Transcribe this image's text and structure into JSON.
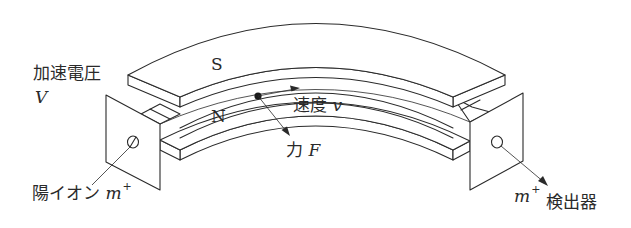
{
  "diagram": {
    "type": "mass-spectrometer",
    "labels": {
      "accel_voltage": "加速電圧",
      "accel_voltage_symbol": "V",
      "pole_top": "S",
      "pole_bottom": "N",
      "velocity": "速度",
      "velocity_symbol": "v",
      "force": "力",
      "force_symbol": "F",
      "ion_source": "陽イオン",
      "ion_mass": "m",
      "ion_charge": "+",
      "detector_mass": "m",
      "detector_charge": "+",
      "detector": "検出器"
    },
    "colors": {
      "stroke": "#2a2a2a",
      "background": "#ffffff"
    }
  }
}
